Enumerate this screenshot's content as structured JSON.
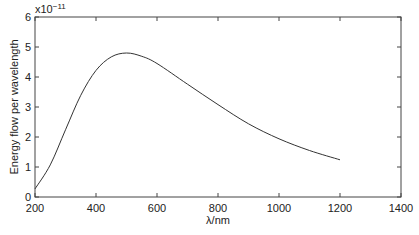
{
  "chart_data": {
    "type": "line",
    "title": "",
    "xlabel": "λ/nm",
    "ylabel": "Energy flow per wavelength",
    "y_multiplier": "x10",
    "y_exponent": "−11",
    "xlim": [
      200,
      1400
    ],
    "ylim": [
      0,
      6
    ],
    "x_ticks": [
      200,
      400,
      600,
      800,
      1000,
      1200,
      1400
    ],
    "y_ticks": [
      0,
      1,
      2,
      3,
      4,
      5,
      6
    ],
    "grid": false,
    "legend": null,
    "series": [
      {
        "name": "Energy flow per wavelength",
        "color": "#333333",
        "x": [
          200,
          250,
          300,
          350,
          400,
          450,
          500,
          550,
          600,
          700,
          800,
          900,
          1000,
          1100,
          1200
        ],
        "y": [
          0.27,
          1.07,
          2.24,
          3.39,
          4.22,
          4.67,
          4.8,
          4.69,
          4.45,
          3.76,
          3.08,
          2.44,
          1.94,
          1.55,
          1.24
        ]
      }
    ]
  }
}
